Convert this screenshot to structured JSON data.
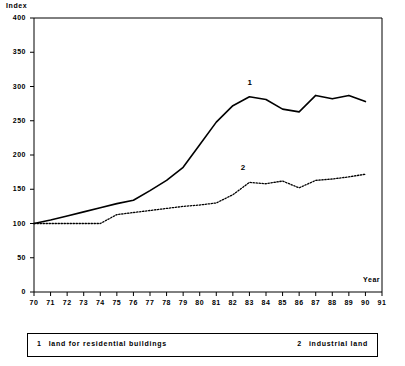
{
  "chart_data": {
    "type": "line",
    "title": "",
    "xlabel": "Year",
    "ylabel": "Index",
    "xlim": [
      70,
      91
    ],
    "ylim": [
      0,
      400
    ],
    "grid": false,
    "legend_position": "bottom",
    "x": [
      70,
      71,
      72,
      73,
      74,
      75,
      76,
      77,
      78,
      79,
      80,
      81,
      82,
      83,
      84,
      85,
      86,
      87,
      88,
      89,
      90
    ],
    "xtick_labels": [
      "70",
      "71",
      "72",
      "73",
      "74",
      "75",
      "76",
      "77",
      "78",
      "79",
      "80",
      "81",
      "82",
      "83",
      "84",
      "85",
      "86",
      "87",
      "88",
      "89",
      "90",
      "91"
    ],
    "ytick_labels": [
      "0",
      "50",
      "100",
      "150",
      "200",
      "250",
      "300",
      "350",
      "400"
    ],
    "ytick_values": [
      0,
      50,
      100,
      150,
      200,
      250,
      300,
      350,
      400
    ],
    "series": [
      {
        "key": "1",
        "name": "land for residential buildings",
        "style": "solid",
        "color": "#000000",
        "label_text": "1",
        "label_x": 83,
        "label_y": 305,
        "values": [
          100,
          105,
          111,
          117,
          123,
          129,
          134,
          148,
          163,
          182,
          215,
          248,
          272,
          285,
          281,
          267,
          263,
          287,
          282,
          287,
          278
        ]
      },
      {
        "key": "2",
        "name": "industrial land",
        "style": "dotted",
        "color": "#000000",
        "label_text": "2",
        "label_x": 82.6,
        "label_y": 181,
        "values": [
          100,
          100,
          100,
          100,
          100,
          113,
          116,
          119,
          122,
          125,
          127,
          130,
          142,
          160,
          158,
          162,
          152,
          163,
          165,
          168,
          172
        ]
      }
    ]
  },
  "legend": {
    "entries": [
      {
        "key": "1",
        "label": "land for residential buildings"
      },
      {
        "key": "2",
        "label": "industrial land"
      }
    ]
  }
}
